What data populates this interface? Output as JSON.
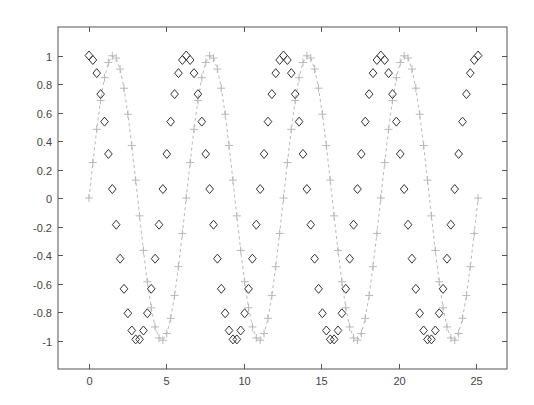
{
  "figure": {
    "background": "#ffffff",
    "axes_color": "#555555",
    "tick_label_color": "#444444"
  },
  "chart_data": {
    "type": "line",
    "title": "",
    "xlabel": "",
    "ylabel": "",
    "xlim": [
      -2,
      27
    ],
    "ylim": [
      -1.2,
      1.2
    ],
    "grid": false,
    "legend": null,
    "xticks": [
      0,
      5,
      10,
      15,
      20,
      25
    ],
    "xtick_labels": [
      "0",
      "5",
      "10",
      "15",
      "20",
      "25"
    ],
    "yticks": [
      -1,
      -0.8,
      -0.6,
      -0.4,
      -0.2,
      0,
      0.2,
      0.4,
      0.6,
      0.8,
      1
    ],
    "ytick_labels": [
      "-1",
      "-0.8",
      "-0.6",
      "-0.4",
      "-0.2",
      "0",
      "0.2",
      "0.4",
      "0.6",
      "0.8",
      "1"
    ],
    "x_domain": {
      "start": 0,
      "end": 25.1327,
      "num_points": 101,
      "description": "x = 0 to 8*pi, ~101 samples (step ~0.251)"
    },
    "series": [
      {
        "name": "sin(x)",
        "function": "sin",
        "marker": "plus",
        "line_style": "dashed",
        "color": "#b8b8b8",
        "marker_size": 4
      },
      {
        "name": "cos(x)",
        "function": "cos",
        "marker": "diamond",
        "line_style": "none",
        "color": "#333333",
        "marker_size": 4.5
      }
    ]
  }
}
